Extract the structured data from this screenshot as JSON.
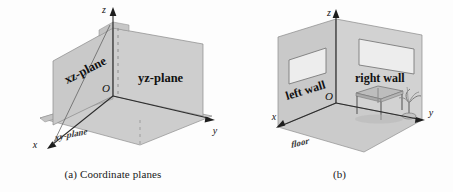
{
  "figure": {
    "background_color": "#fdfdfd",
    "plane_fill": "#c9c9c9",
    "plane_fill_light": "#d6d6d6",
    "floor_fill": "#cfcfcf",
    "window_fill": "#ededed",
    "stroke_color": "#6e6e6e",
    "axis_color": "#2b2b2b",
    "text_color": "#111111"
  },
  "panel_a": {
    "caption": "(a) Coordinate planes",
    "origin_label": "O",
    "axes": [
      {
        "name": "x-axis",
        "label": "x"
      },
      {
        "name": "y-axis",
        "label": "y"
      },
      {
        "name": "z-axis",
        "label": "z"
      }
    ],
    "planes": [
      {
        "name": "xz-plane",
        "label": "xz-plane"
      },
      {
        "name": "yz-plane",
        "label": "yz-plane"
      },
      {
        "name": "xy-plane",
        "label": "xy-plane"
      }
    ]
  },
  "panel_b": {
    "caption": "(b)",
    "origin_label": "O",
    "axes": [
      {
        "name": "x-axis",
        "label": "x"
      },
      {
        "name": "y-axis",
        "label": "y"
      },
      {
        "name": "z-axis",
        "label": "z"
      }
    ],
    "surfaces": [
      {
        "name": "left-wall",
        "label": "left wall"
      },
      {
        "name": "right-wall",
        "label": "right wall"
      },
      {
        "name": "floor",
        "label": "floor"
      }
    ],
    "objects": [
      {
        "name": "table",
        "label": "table"
      },
      {
        "name": "plant",
        "label": "plant"
      },
      {
        "name": "left-wall-window",
        "label": "window"
      },
      {
        "name": "right-wall-window",
        "label": "window"
      }
    ]
  }
}
